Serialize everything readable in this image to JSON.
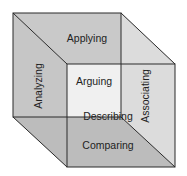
{
  "diagram": {
    "type": "cube",
    "labels": {
      "top": "Applying",
      "left": "Analyzing",
      "right": "Associating",
      "front": "Arguing",
      "center": "Describing",
      "bottom": "Comparing"
    },
    "colors": {
      "stroke": "#2a2a2a",
      "top_face": "#c9c9c9",
      "left_face": "#c6c6c6",
      "bottom_face": "#bcbcbc",
      "right_face": "#dcdcdc",
      "front_overlap": "#f0f0f0",
      "back_face": "#c9c9c9"
    }
  }
}
